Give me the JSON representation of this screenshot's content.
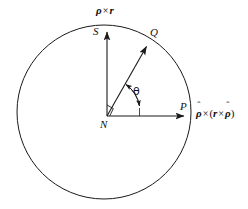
{
  "figure": {
    "background_color": "#ffffff",
    "stroke_color": "#1a1a1a",
    "circle": {
      "center_x": 104,
      "center_y": 112,
      "radius": 87,
      "stroke_width": 1.0,
      "fill": "none"
    },
    "points": {
      "center": {
        "label": "N",
        "x": 107,
        "y": 116
      },
      "top": {
        "label": "S",
        "x": 107,
        "y": 27
      },
      "right": {
        "label": "P",
        "x": 190,
        "y": 116
      },
      "diagonal": {
        "label": "Q",
        "x": 152,
        "y": 40
      }
    },
    "angle": {
      "symbol": "θ",
      "value_deg": 50,
      "arc_radius": 30,
      "label_x": 134,
      "label_y": 88
    },
    "right_angle_marker": {
      "present": true,
      "size": 11,
      "at_point": "N",
      "between": [
        "vertical-axis",
        "radius-to-Q"
      ]
    },
    "axes": [
      {
        "name": "vertical-axis",
        "from": "N",
        "to": "S",
        "arrow": true,
        "label": {
          "parts": [
            {
              "type": "hat-bold-italic",
              "text": "ρ"
            },
            {
              "type": "op",
              "text": "×"
            },
            {
              "type": "bold-italic",
              "text": "r"
            }
          ],
          "plain": "ρ̂ × r",
          "x": 97,
          "y": 7
        }
      },
      {
        "name": "horizontal-axis",
        "from": "N",
        "to": "P",
        "arrow": true,
        "label": {
          "parts": [
            {
              "type": "hat-bold-italic",
              "text": "ρ"
            },
            {
              "type": "op",
              "text": "×"
            },
            {
              "type": "paren",
              "text": "("
            },
            {
              "type": "bold-italic",
              "text": "r"
            },
            {
              "type": "op",
              "text": "×"
            },
            {
              "type": "hat-bold-italic",
              "text": "ρ"
            },
            {
              "type": "paren",
              "text": ")"
            }
          ],
          "plain": "ρ̂ × (r × ρ̂)",
          "x": 196,
          "y": 110
        }
      },
      {
        "name": "radius-to-Q",
        "from": "N",
        "to": "Q",
        "arrow": true,
        "label": null
      }
    ],
    "labels": {
      "N": "N",
      "S": "S",
      "P": "P",
      "Q": "Q",
      "theta": "θ",
      "rho_hat": "ρ̂",
      "r_vec": "r",
      "times": "×",
      "paren_open": "(",
      "paren_close": ")"
    }
  }
}
